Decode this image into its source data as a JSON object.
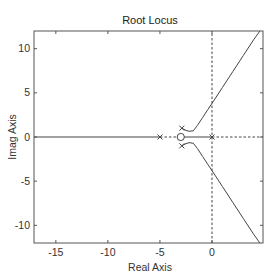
{
  "chart_data": {
    "type": "line",
    "title": "Root Locus",
    "xlabel": "Real Axis",
    "ylabel": "Imag Axis",
    "xlim": [
      -17.1,
      4.9
    ],
    "ylim": [
      -12.0,
      12.0
    ],
    "xticks": [
      -15,
      -10,
      -5,
      0
    ],
    "yticks": [
      -10,
      -5,
      0,
      5,
      10
    ],
    "xtick_labels": [
      "-15",
      "-10",
      "-5",
      "0"
    ],
    "ytick_labels": [
      "-10",
      "-5",
      "0",
      "5",
      "10"
    ],
    "grid": false,
    "legend": null,
    "poles": [
      {
        "re": -5.0,
        "im": 0.0
      },
      {
        "re": -2.9,
        "im": 1.0
      },
      {
        "re": -2.9,
        "im": -1.0
      },
      {
        "re": 0.0,
        "im": 0.0
      }
    ],
    "zeros": [
      {
        "re": -3.0,
        "im": 0.0
      }
    ],
    "series": [
      {
        "name": "branch-real-left",
        "style": "solid",
        "x": [
          -17.1,
          -5.0
        ],
        "y": [
          0.0,
          0.0
        ]
      },
      {
        "name": "branch-real-zero-to-origin",
        "style": "solid",
        "x": [
          -3.0,
          0.0
        ],
        "y": [
          0.0,
          0.0
        ]
      },
      {
        "name": "branch-upper",
        "style": "solid",
        "x": [
          -2.9,
          -2.5,
          -2.2,
          -1.8,
          -1.4,
          -0.9,
          -0.4,
          0.0,
          1.0,
          2.0,
          3.0,
          4.0,
          4.6
        ],
        "y": [
          1.0,
          0.75,
          0.65,
          0.7,
          1.3,
          2.2,
          3.1,
          3.8,
          5.6,
          7.4,
          9.2,
          11.0,
          12.0
        ]
      },
      {
        "name": "branch-lower",
        "style": "solid",
        "x": [
          -2.9,
          -2.5,
          -2.2,
          -1.8,
          -1.4,
          -0.9,
          -0.4,
          0.0,
          1.0,
          2.0,
          3.0,
          4.0,
          4.6
        ],
        "y": [
          -1.0,
          -0.75,
          -0.65,
          -0.7,
          -1.3,
          -2.2,
          -3.1,
          -3.8,
          -5.6,
          -7.4,
          -9.2,
          -11.0,
          -12.0
        ]
      }
    ],
    "reference_lines": [
      {
        "name": "imag-axis",
        "style": "dotted",
        "x": [
          0,
          0
        ],
        "y": [
          -12.0,
          12.0
        ]
      },
      {
        "name": "real-axis-segment-pole-to-zero",
        "style": "dotted",
        "x": [
          -5.0,
          -3.0
        ],
        "y": [
          0,
          0
        ]
      },
      {
        "name": "real-axis-right",
        "style": "dotted",
        "x": [
          0.0,
          4.9
        ],
        "y": [
          0,
          0
        ]
      }
    ]
  },
  "colors": {
    "line": "#444444",
    "axis": "#555555",
    "text": "#333333",
    "background": "#ffffff"
  }
}
